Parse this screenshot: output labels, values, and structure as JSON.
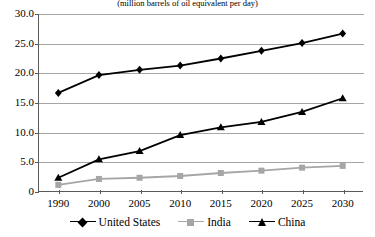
{
  "chart_data": {
    "type": "line",
    "title": "(million barrels of oil equivalent per day)",
    "xlabel": "",
    "ylabel": "",
    "categories": [
      "1990",
      "2000",
      "2005",
      "2010",
      "2015",
      "2020",
      "2025",
      "2030"
    ],
    "ylim": [
      0,
      30
    ],
    "yticks": [
      0,
      5,
      10,
      15,
      20,
      25,
      30
    ],
    "ytick_labels": [
      "0",
      "5.0",
      "10.0",
      "15.0",
      "20.0",
      "25.0",
      "30.0"
    ],
    "grid": true,
    "legend_position": "bottom",
    "series": [
      {
        "name": "United States",
        "color": "#000000",
        "marker": "diamond",
        "values": [
          16.7,
          19.7,
          20.6,
          21.3,
          22.5,
          23.8,
          25.1,
          26.7
        ]
      },
      {
        "name": "India",
        "color": "#a6a6a6",
        "marker": "square",
        "values": [
          1.2,
          2.2,
          2.4,
          2.7,
          3.2,
          3.6,
          4.1,
          4.4
        ]
      },
      {
        "name": "China",
        "color": "#000000",
        "marker": "triangle",
        "values": [
          2.4,
          5.5,
          6.9,
          9.6,
          10.9,
          11.8,
          13.5,
          15.8
        ]
      }
    ]
  },
  "legend": {
    "items": [
      {
        "label": "United States"
      },
      {
        "label": "India"
      },
      {
        "label": "China"
      }
    ]
  }
}
